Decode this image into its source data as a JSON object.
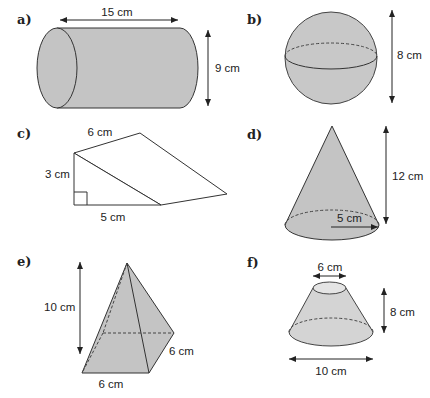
{
  "colors": {
    "shape_fill": "#c4c4c4",
    "shape_fill_light": "#d4d4d4",
    "outline": "#333333",
    "background": "#ffffff"
  },
  "shapes": [
    {
      "id": "a",
      "label": "a)",
      "type": "cylinder",
      "dimensions": {
        "length": "15 cm",
        "diameter": "9 cm"
      }
    },
    {
      "id": "b",
      "label": "b)",
      "type": "sphere",
      "dimensions": {
        "diameter": "8 cm"
      }
    },
    {
      "id": "c",
      "label": "c)",
      "type": "triangular-prism",
      "dimensions": {
        "length": "6 cm",
        "height": "3 cm",
        "base": "5 cm"
      }
    },
    {
      "id": "d",
      "label": "d)",
      "type": "cone",
      "dimensions": {
        "height": "12 cm",
        "radius": "5 cm"
      }
    },
    {
      "id": "e",
      "label": "e)",
      "type": "square-pyramid",
      "dimensions": {
        "height": "10 cm",
        "base_width": "6 cm",
        "base_depth": "6 cm"
      }
    },
    {
      "id": "f",
      "label": "f)",
      "type": "frustum",
      "dimensions": {
        "top_diameter": "6 cm",
        "height": "8 cm",
        "base_diameter": "10 cm"
      }
    }
  ]
}
